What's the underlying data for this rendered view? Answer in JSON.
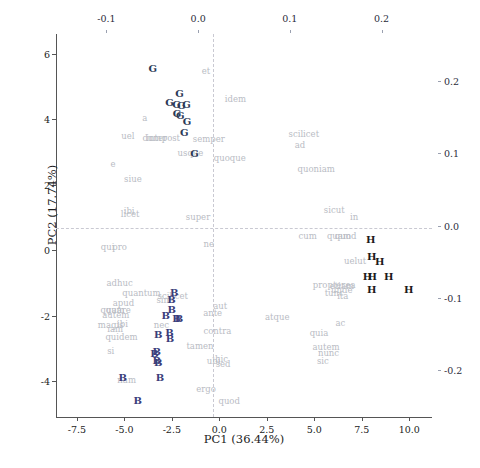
{
  "chart_data": {
    "type": "scatter",
    "title": "",
    "xlabel": "PC1 (36.44%)",
    "ylabel": "PC2 (17.74%)",
    "xlim": [
      -8.6,
      11.2
    ],
    "ylim": [
      -5.1,
      6.6
    ],
    "grid": false,
    "legend": "none",
    "x_ticks": [
      "-7.5",
      "-5.0",
      "-2.5",
      "0.0",
      "2.5",
      "5.0",
      "7.5",
      "10.0"
    ],
    "x_tick_values": [
      -7.5,
      -5.0,
      -2.5,
      0.0,
      2.5,
      5.0,
      7.5,
      10.0
    ],
    "y_ticks": [
      "6",
      "4",
      "2",
      "0",
      "-2",
      "-4"
    ],
    "y_tick_values": [
      6,
      4,
      2,
      0,
      -2,
      -4
    ],
    "secondary_top_ticks": [
      "-0.1",
      "0.0",
      "0.1",
      "0.2"
    ],
    "secondary_top_values": [
      -0.1,
      0.0,
      0.1,
      0.2
    ],
    "secondary_right_ticks": [
      "0.2",
      "0.1",
      "0.0",
      "-0.1",
      "-0.2"
    ],
    "secondary_right_values": [
      0.2,
      0.1,
      0.0,
      -0.1,
      -0.2
    ],
    "series": [
      {
        "name": "G",
        "color": "#2c3a57",
        "points": [
          {
            "label": "G",
            "x": -3.5,
            "y": 5.52
          },
          {
            "label": "G",
            "x": -2.1,
            "y": 4.78
          },
          {
            "label": "G",
            "x": -2.62,
            "y": 4.48
          },
          {
            "label": "G",
            "x": -2.25,
            "y": 4.42
          },
          {
            "label": "G",
            "x": -2.0,
            "y": 4.4
          },
          {
            "label": "G",
            "x": -1.72,
            "y": 4.44
          },
          {
            "label": "G",
            "x": -2.22,
            "y": 4.15
          },
          {
            "label": "G",
            "x": -2.05,
            "y": 4.1
          },
          {
            "label": "G",
            "x": -1.7,
            "y": 3.92
          },
          {
            "label": "G",
            "x": -1.85,
            "y": 3.58
          },
          {
            "label": "G",
            "x": -1.3,
            "y": 2.92
          }
        ]
      },
      {
        "name": "B",
        "color": "#3a3d7a",
        "points": [
          {
            "label": "B",
            "x": -2.38,
            "y": -1.32
          },
          {
            "label": "B",
            "x": -2.52,
            "y": -1.52
          },
          {
            "label": "B",
            "x": -2.5,
            "y": -1.82
          },
          {
            "label": "B",
            "x": -2.82,
            "y": -2.02
          },
          {
            "label": "B",
            "x": -2.25,
            "y": -2.1
          },
          {
            "label": "B",
            "x": -2.12,
            "y": -2.12
          },
          {
            "label": "B",
            "x": -3.22,
            "y": -2.58
          },
          {
            "label": "B",
            "x": -2.62,
            "y": -2.52
          },
          {
            "label": "B",
            "x": -2.6,
            "y": -2.72
          },
          {
            "label": "B",
            "x": -3.3,
            "y": -3.1
          },
          {
            "label": "B",
            "x": -3.42,
            "y": -3.18
          },
          {
            "label": "B",
            "x": -3.3,
            "y": -3.38
          },
          {
            "label": "B",
            "x": -3.22,
            "y": -3.45
          },
          {
            "label": "B",
            "x": -5.08,
            "y": -3.92
          },
          {
            "label": "B",
            "x": -3.12,
            "y": -3.92
          },
          {
            "label": "B",
            "x": -4.3,
            "y": -4.6
          }
        ]
      },
      {
        "name": "H",
        "color": "#1b1b1b",
        "points": [
          {
            "label": "H",
            "x": 7.98,
            "y": 0.32
          },
          {
            "label": "H",
            "x": 8.02,
            "y": -0.22
          },
          {
            "label": "H",
            "x": 8.45,
            "y": -0.38
          },
          {
            "label": "H",
            "x": 7.8,
            "y": -0.82
          },
          {
            "label": "H",
            "x": 8.05,
            "y": -0.82
          },
          {
            "label": "H",
            "x": 8.92,
            "y": -0.82
          },
          {
            "label": "H",
            "x": 8.02,
            "y": -1.22
          },
          {
            "label": "H",
            "x": 9.98,
            "y": -1.22
          }
        ]
      }
    ],
    "loadings": [
      {
        "label": "et",
        "x": -0.7,
        "y": 5.46
      },
      {
        "label": "idem",
        "x": 0.85,
        "y": 4.62
      },
      {
        "label": "a",
        "x": -3.92,
        "y": 4.02
      },
      {
        "label": "uel",
        "x": -4.82,
        "y": 3.48
      },
      {
        "label": "dum",
        "x": -3.55,
        "y": 3.42
      },
      {
        "label": "inter",
        "x": -3.3,
        "y": 3.42
      },
      {
        "label": "post",
        "x": -2.55,
        "y": 3.42
      },
      {
        "label": "semper",
        "x": -0.55,
        "y": 3.38
      },
      {
        "label": "usque",
        "x": -1.52,
        "y": 2.95
      },
      {
        "label": "quoque",
        "x": 0.55,
        "y": 2.8
      },
      {
        "label": "e",
        "x": -5.6,
        "y": 2.62
      },
      {
        "label": "scilicet",
        "x": 4.45,
        "y": 3.55
      },
      {
        "label": "ad",
        "x": 4.25,
        "y": 3.22
      },
      {
        "label": "quoniam",
        "x": 5.1,
        "y": 2.48
      },
      {
        "label": "siue",
        "x": -4.55,
        "y": 2.18
      },
      {
        "label": "licet",
        "x": -4.7,
        "y": 1.1
      },
      {
        "label": "ibi",
        "x": -4.75,
        "y": 1.2
      },
      {
        "label": "super",
        "x": -1.12,
        "y": 1.02
      },
      {
        "label": "sicut",
        "x": 6.05,
        "y": 1.22
      },
      {
        "label": "in",
        "x": 7.1,
        "y": 1.0
      },
      {
        "label": "cum",
        "x": 4.65,
        "y": 0.42
      },
      {
        "label": "quam",
        "x": 6.3,
        "y": 0.42
      },
      {
        "label": "quod",
        "x": 6.65,
        "y": 0.42
      },
      {
        "label": "qui",
        "x": -5.88,
        "y": 0.1
      },
      {
        "label": "pro",
        "x": -5.25,
        "y": 0.1
      },
      {
        "label": "ne",
        "x": -0.55,
        "y": 0.18
      },
      {
        "label": "uelut",
        "x": 7.15,
        "y": -0.32
      },
      {
        "label": "adhuc",
        "x": -5.25,
        "y": -1.02
      },
      {
        "label": "quantum",
        "x": -4.1,
        "y": -1.32
      },
      {
        "label": "scilicet2",
        "x": -2.45,
        "y": -1.4
      },
      {
        "label": "sine",
        "x": -2.85,
        "y": -1.52
      },
      {
        "label": "propterea",
        "x": 6.05,
        "y": -1.08
      },
      {
        "label": "etiam",
        "x": 6.45,
        "y": -1.1
      },
      {
        "label": "apud",
        "x": -5.05,
        "y": -1.62
      },
      {
        "label": "quam2",
        "x": -5.62,
        "y": -1.82
      },
      {
        "label": "quare",
        "x": -5.32,
        "y": -1.82
      },
      {
        "label": "autem",
        "x": -5.45,
        "y": -1.98
      },
      {
        "label": "aut",
        "x": 0.05,
        "y": -1.72
      },
      {
        "label": "ante",
        "x": -0.35,
        "y": -1.92
      },
      {
        "label": "magis",
        "x": -5.72,
        "y": -2.28
      },
      {
        "label": "ibi2",
        "x": -5.1,
        "y": -2.26
      },
      {
        "label": "iam",
        "x": -5.48,
        "y": -2.42
      },
      {
        "label": "nec",
        "x": -3.05,
        "y": -2.28
      },
      {
        "label": "quidem",
        "x": -5.15,
        "y": -2.66
      },
      {
        "label": "atque",
        "x": 3.05,
        "y": -2.06
      },
      {
        "label": "quia",
        "x": 5.25,
        "y": -2.52
      },
      {
        "label": "ac",
        "x": 6.38,
        "y": -2.22
      },
      {
        "label": "contra",
        "x": -0.1,
        "y": -2.48
      },
      {
        "label": "tamen",
        "x": -1.02,
        "y": -2.92
      },
      {
        "label": "si",
        "x": -5.72,
        "y": -3.08
      },
      {
        "label": "autem2",
        "x": 5.62,
        "y": -2.96
      },
      {
        "label": "nunc",
        "x": 5.75,
        "y": -3.16
      },
      {
        "label": "sic",
        "x": 5.45,
        "y": -3.4
      },
      {
        "label": "ubi",
        "x": -0.3,
        "y": -3.4
      },
      {
        "label": "hic",
        "x": 0.12,
        "y": -3.32
      },
      {
        "label": "sed",
        "x": 0.2,
        "y": -3.48
      },
      {
        "label": "nam",
        "x": -4.88,
        "y": -3.98
      },
      {
        "label": "ergo",
        "x": -0.7,
        "y": -4.25
      },
      {
        "label": "quod2",
        "x": 0.52,
        "y": -4.62
      },
      {
        "label": "tunc",
        "x": 6.05,
        "y": -1.32
      },
      {
        "label": "unde",
        "x": 6.45,
        "y": -1.22
      },
      {
        "label": "ita",
        "x": 6.5,
        "y": -1.4
      }
    ],
    "loading_display": {
      "scilicet2": "scilicet",
      "quam2": "quam",
      "ibi2": "ibi",
      "autem2": "autem",
      "quod2": "quod"
    }
  }
}
